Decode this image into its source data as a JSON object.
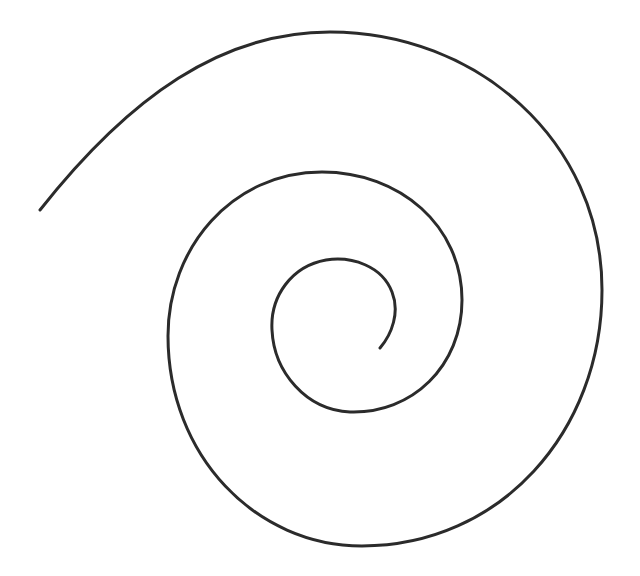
{
  "drawing": {
    "subject": "hand-drawn spiral",
    "stroke_color": "#2b2b2b",
    "background": "#ffffff",
    "path": "M 380 348 C 392 334, 400 312, 392 292 C 382 266, 352 256, 326 260 C 292 266, 270 296, 272 330 C 274 372, 306 410, 350 412 C 412 414, 462 366, 462 300 C 462 226, 400 172, 322 172 C 232 172, 168 248, 168 336 C 168 456, 256 546, 362 546 C 500 546, 602 432, 602 290 C 602 140, 476 32, 330 32 C 222 32, 130 96, 40 210"
  }
}
